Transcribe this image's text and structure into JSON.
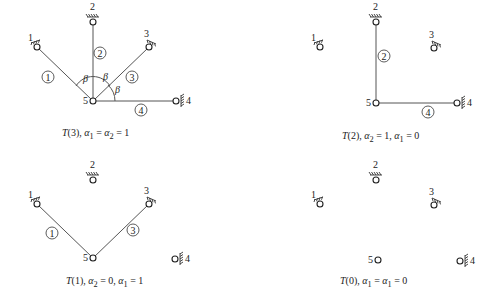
{
  "panels": [
    {
      "id": "T3",
      "caption": "T(3), α1 = α2 = 1",
      "caption_parts": {
        "fn": "T",
        "arg": "(3), ",
        "a": "α",
        "s1": "1",
        "eq1": " = ",
        "s2": "2",
        "eq2": " = 1"
      },
      "nodes": {
        "1": [
          37,
          47
        ],
        "2": [
          93,
          22
        ],
        "3": [
          149,
          47
        ],
        "4": [
          176,
          101
        ],
        "5": [
          93,
          101
        ]
      },
      "members": [
        {
          "label": "1",
          "from": "1",
          "to": "5",
          "circle": [
            48,
            77
          ]
        },
        {
          "label": "2",
          "from": "2",
          "to": "5",
          "circle": [
            100,
            53
          ]
        },
        {
          "label": "3",
          "from": "3",
          "to": "5",
          "circle": [
            132,
            77
          ]
        },
        {
          "label": "4",
          "from": "4",
          "to": "5",
          "circle": [
            141,
            110
          ]
        }
      ],
      "angle_label": "β",
      "angles": [
        [
          83,
          82
        ],
        [
          103,
          80
        ],
        [
          115,
          93
        ]
      ]
    },
    {
      "id": "T2",
      "caption": "T(2), α2 = 1, α1 = 0",
      "caption_parts": {
        "fn": "T",
        "arg": "(2), ",
        "a": "α",
        "s1": "2",
        "eq1": " = 1, ",
        "s2": "1",
        "eq2": " = 0"
      },
      "nodes": {
        "1": [
          320,
          47
        ],
        "2": [
          376,
          22
        ],
        "3": [
          434,
          48
        ],
        "4": [
          457,
          103
        ],
        "5": [
          376,
          103
        ]
      },
      "members": [
        {
          "label": "2",
          "from": "2",
          "to": "5",
          "circle": [
            384,
            56
          ]
        },
        {
          "label": "4",
          "from": "4",
          "to": "5",
          "circle": [
            428,
            112
          ]
        }
      ]
    },
    {
      "id": "T1",
      "caption": "T(1), α2 = 0, α1 = 1",
      "caption_parts": {
        "fn": "T",
        "arg": "(1), ",
        "a": "α",
        "s1": "2",
        "eq1": " = 0, ",
        "s2": "1",
        "eq2": " = 1"
      },
      "nodes": {
        "1": [
          37,
          204
        ],
        "2": [
          93,
          180
        ],
        "3": [
          149,
          204
        ],
        "4": [
          175,
          259
        ],
        "5": [
          93,
          258
        ]
      },
      "members": [
        {
          "label": "1",
          "from": "1",
          "to": "5",
          "circle": [
            52,
            233
          ]
        },
        {
          "label": "3",
          "from": "3",
          "to": "5",
          "circle": [
            133,
            230
          ]
        }
      ]
    },
    {
      "id": "T0",
      "caption": "T(0), α1 = α1 = 0",
      "caption_parts": {
        "fn": "T",
        "arg": "(0), ",
        "a": "α",
        "s1": "1",
        "eq1": " = ",
        "s2": "1",
        "eq2": " = 0"
      },
      "nodes": {
        "1": [
          320,
          204
        ],
        "2": [
          376,
          180
        ],
        "3": [
          434,
          205
        ],
        "4": [
          460,
          261
        ],
        "5": [
          378,
          260
        ]
      },
      "members": []
    }
  ],
  "node_labels": {
    "1": "1",
    "2": "2",
    "3": "3",
    "4": "4",
    "5": "5"
  }
}
